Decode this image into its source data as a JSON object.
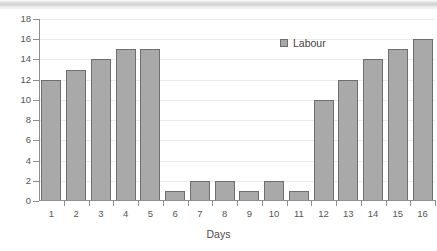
{
  "chart_data": {
    "type": "bar",
    "title": "",
    "subtitle": "",
    "xlabel": "Days",
    "ylabel": "",
    "categories": [
      "1",
      "2",
      "3",
      "4",
      "5",
      "6",
      "7",
      "8",
      "9",
      "10",
      "11",
      "12",
      "13",
      "14",
      "15",
      "16"
    ],
    "values": [
      12,
      13,
      14,
      15,
      15,
      1,
      2,
      2,
      1,
      2,
      1,
      10,
      12,
      14,
      15,
      16
    ],
    "series": [
      {
        "name": "Labour",
        "values": [
          12,
          13,
          14,
          15,
          15,
          1,
          2,
          2,
          1,
          2,
          1,
          10,
          12,
          14,
          15,
          16
        ]
      }
    ],
    "ylim": [
      0,
      18
    ],
    "xlim": [
      0,
      16
    ],
    "y_ticks": [
      0,
      2,
      4,
      6,
      8,
      10,
      12,
      14,
      16,
      18
    ],
    "y_tick_labels": [
      "0",
      "2",
      "4",
      "6",
      "8",
      "10",
      "12",
      "14",
      "16",
      "18"
    ],
    "x_tick_labels": [
      "1",
      "2",
      "3",
      "4",
      "5",
      "6",
      "7",
      "8",
      "9",
      "10",
      "11",
      "12",
      "13",
      "14",
      "15",
      "16"
    ],
    "grid": true,
    "grid_axis": "y",
    "legend": {
      "position": "top-right-inside",
      "entries": [
        {
          "label": "Labour",
          "color": "#a9a9a9",
          "edge_color": "#6e6e6e"
        }
      ]
    },
    "bar_fill_color": "#a9a9a9",
    "bar_edge_color": "#6e6e6e",
    "axis_color": "#8e8e8e",
    "grid_color": "#eceaea",
    "text_color": "#555555",
    "background": "#ffffff"
  },
  "axes": {
    "x_title": "Days"
  },
  "legend": {
    "label": "Labour"
  }
}
